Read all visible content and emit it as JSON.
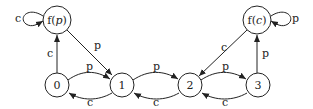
{
  "diagram": {
    "type": "state-transition",
    "nodes": [
      {
        "id": "fp",
        "label": "f(p)",
        "label_text": "f(",
        "label_var": "p",
        "label_close": ")"
      },
      {
        "id": "fc",
        "label": "f(c)",
        "label_text": "f(",
        "label_var": "c",
        "label_close": ")"
      },
      {
        "id": "n0",
        "label": "0"
      },
      {
        "id": "n1",
        "label": "1"
      },
      {
        "id": "n2",
        "label": "2"
      },
      {
        "id": "n3",
        "label": "3"
      }
    ],
    "edges": [
      {
        "from": "fp",
        "to": "fp",
        "label": "c"
      },
      {
        "from": "n0",
        "to": "fp",
        "label": "c"
      },
      {
        "from": "fp",
        "to": "n1",
        "label": "p"
      },
      {
        "from": "n0",
        "to": "n1",
        "label": "p"
      },
      {
        "from": "n1",
        "to": "n0",
        "label": "c"
      },
      {
        "from": "n1",
        "to": "n2",
        "label": "p"
      },
      {
        "from": "n2",
        "to": "n1",
        "label": "c"
      },
      {
        "from": "n2",
        "to": "n3",
        "label": "p"
      },
      {
        "from": "n3",
        "to": "n2",
        "label": "c"
      },
      {
        "from": "n3",
        "to": "fc",
        "label": "p"
      },
      {
        "from": "fc",
        "to": "n2",
        "label": "c"
      },
      {
        "from": "fc",
        "to": "fc",
        "label": "p"
      }
    ]
  }
}
